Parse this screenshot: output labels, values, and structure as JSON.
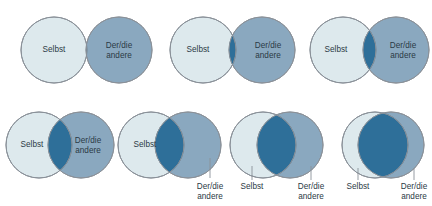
{
  "figure": {
    "background_color": "#ffffff",
    "colors": {
      "self_fill": "#dde9ed",
      "other_fill": "#8aa8bf",
      "overlap_fill": "#2e6f99",
      "outline": "#8a9199",
      "text": "#2b3a45",
      "leader_line": "#8a9199"
    },
    "labels": {
      "self": "Selbst",
      "other_line1": "Der/die",
      "other_line2": "andere"
    }
  },
  "diagrams": [
    {
      "id": "diagram-1",
      "overlap_level": 0,
      "self_label": "Selbst",
      "other_label_line1": "Der/die",
      "other_label_line2": "andere",
      "labels_inside": true,
      "has_leader_lines": false,
      "geometry": {
        "cx_self": 54,
        "cx_other": 119,
        "cy": 50,
        "r": 33,
        "self_text_x": 54,
        "self_text_y": 50,
        "other_text_x": 119,
        "other_text_y": 46
      }
    },
    {
      "id": "diagram-2",
      "overlap_level": 1,
      "self_label": "Selbst",
      "other_label_line1": "Der/die",
      "other_label_line2": "andere",
      "labels_inside": true,
      "has_leader_lines": false,
      "geometry": {
        "cx_self": 203,
        "cx_other": 262,
        "cy": 50,
        "r": 33,
        "self_text_x": 198,
        "self_text_y": 50,
        "other_text_x": 268,
        "other_text_y": 46
      }
    },
    {
      "id": "diagram-3",
      "overlap_level": 2,
      "self_label": "Selbst",
      "other_label_line1": "Der/die",
      "other_label_line2": "andere",
      "labels_inside": true,
      "has_leader_lines": false,
      "geometry": {
        "cx_self": 343,
        "cx_other": 396,
        "cy": 50,
        "r": 33,
        "self_text_x": 336,
        "self_text_y": 50,
        "other_text_x": 403,
        "other_text_y": 46
      }
    },
    {
      "id": "diagram-4",
      "overlap_level": 3,
      "self_label": "Selbst",
      "other_label_line1": "Der/die",
      "other_label_line2": "andere",
      "labels_inside": true,
      "has_leader_lines": false,
      "geometry": {
        "cx_self": 39,
        "cx_other": 81,
        "cy": 145,
        "r": 33,
        "self_text_x": 32,
        "self_text_y": 145,
        "other_text_x": 88,
        "other_text_y": 141
      }
    },
    {
      "id": "diagram-5",
      "overlap_level": 4,
      "self_label": "Selbst",
      "other_label_line1": "Der/die",
      "other_label_line2": "andere",
      "labels_inside": false,
      "self_label_inside": true,
      "has_leader_lines": true,
      "geometry": {
        "cx_self": 151,
        "cx_other": 188,
        "cy": 145,
        "r": 33,
        "self_text_x": 145,
        "self_text_y": 145,
        "other_text_x": 210,
        "other_text_y": 189,
        "leader_x": 210,
        "leader_y1": 158,
        "leader_y2": 178
      }
    },
    {
      "id": "diagram-6",
      "overlap_level": 5,
      "self_label": "Selbst",
      "other_label_line1": "Der/die",
      "other_label_line2": "andere",
      "labels_inside": false,
      "self_label_inside": false,
      "has_leader_lines": true,
      "geometry": {
        "cx_self": 263,
        "cx_other": 290,
        "cy": 145,
        "r": 33,
        "self_text_x": 252,
        "self_text_y": 189,
        "other_text_x": 311,
        "other_text_y": 189,
        "leader_self_x": 252,
        "leader_self_y1": 166,
        "leader_self_y2": 180,
        "leader_other_x": 311,
        "leader_other_y1": 166,
        "leader_other_y2": 180
      }
    },
    {
      "id": "diagram-7",
      "overlap_level": 6,
      "self_label": "Selbst",
      "other_label_line1": "Der/die",
      "other_label_line2": "andere",
      "labels_inside": false,
      "self_label_inside": false,
      "has_leader_lines": true,
      "geometry": {
        "cx_self": 375,
        "cx_other": 391,
        "cy": 145,
        "r": 33,
        "self_text_x": 358,
        "self_text_y": 189,
        "other_text_x": 414,
        "other_text_y": 189,
        "leader_self_x": 358,
        "leader_self_y1": 168,
        "leader_self_y2": 180,
        "leader_other_x": 414,
        "leader_other_y1": 168,
        "leader_other_y2": 180
      }
    }
  ]
}
